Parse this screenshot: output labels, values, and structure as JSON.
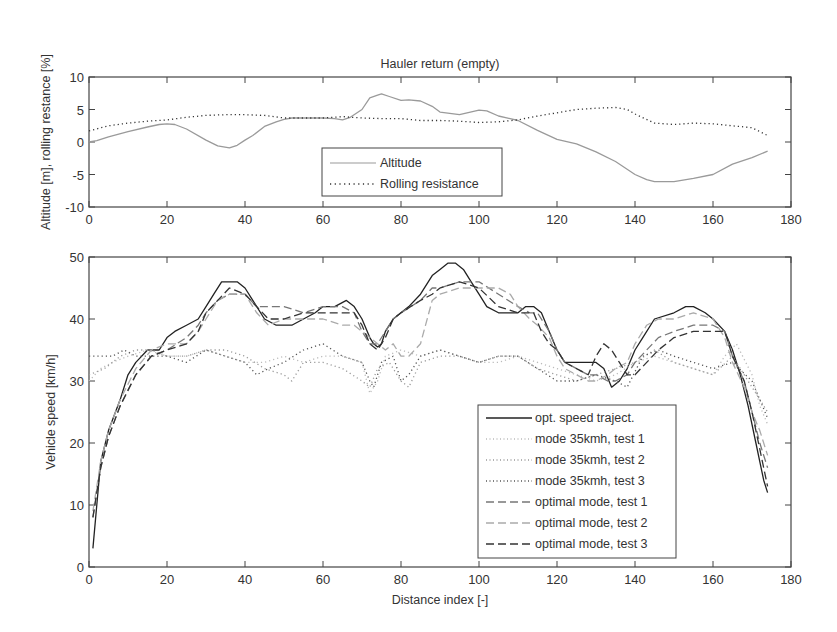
{
  "chart_data": [
    {
      "type": "line",
      "title": "Hauler return (empty)",
      "xlabel": "",
      "ylabel": "Altitude [m], rolling restance [%]",
      "xlim": [
        0,
        180
      ],
      "ylim": [
        -10,
        10
      ],
      "xticks": [
        "0",
        "20",
        "40",
        "60",
        "80",
        "100",
        "120",
        "140",
        "160",
        "180"
      ],
      "yticks": [
        "-10",
        "-5",
        "0",
        "5",
        "10"
      ],
      "grid": false,
      "legend_position": "lower center",
      "series": [
        {
          "name": "Altitude",
          "style": "solid",
          "color": "#9a9a9a",
          "x": [
            0,
            2,
            5,
            10,
            15,
            18,
            20,
            22,
            25,
            30,
            33,
            36,
            38,
            40,
            42,
            45,
            48,
            50,
            52,
            55,
            60,
            63,
            65,
            67,
            70,
            72,
            74,
            75,
            77,
            80,
            82,
            85,
            88,
            90,
            95,
            100,
            102,
            105,
            110,
            115,
            120,
            125,
            130,
            135,
            140,
            143,
            145,
            148,
            150,
            155,
            160,
            165,
            170,
            174
          ],
          "y": [
            0,
            0.2,
            0.8,
            1.6,
            2.3,
            2.7,
            2.8,
            2.7,
            2.0,
            0.3,
            -0.6,
            -0.9,
            -0.5,
            0.3,
            1.0,
            2.4,
            3.1,
            3.5,
            3.7,
            3.7,
            3.7,
            3.6,
            3.4,
            3.8,
            5.0,
            6.8,
            7.2,
            7.4,
            7.0,
            6.4,
            6.5,
            6.3,
            5.5,
            4.6,
            4.2,
            4.9,
            4.8,
            4.0,
            3.3,
            1.8,
            0.4,
            -0.3,
            -1.5,
            -3.0,
            -5.0,
            -5.8,
            -6.1,
            -6.1,
            -6.1,
            -5.6,
            -5.0,
            -3.4,
            -2.4,
            -1.4
          ]
        },
        {
          "name": "Rolling resistance",
          "style": "dotted",
          "color": "#333333",
          "x": [
            0,
            5,
            10,
            15,
            20,
            25,
            30,
            35,
            40,
            45,
            50,
            55,
            60,
            65,
            70,
            75,
            80,
            85,
            90,
            95,
            100,
            105,
            110,
            115,
            120,
            125,
            130,
            135,
            138,
            140,
            145,
            150,
            155,
            160,
            165,
            170,
            174
          ],
          "y": [
            1.7,
            2.5,
            2.9,
            3.2,
            3.4,
            3.8,
            4.1,
            4.2,
            4.2,
            4.1,
            3.7,
            3.7,
            3.7,
            3.9,
            3.7,
            3.6,
            3.6,
            3.3,
            3.3,
            3.2,
            3.0,
            3.1,
            3.4,
            4.0,
            4.5,
            5.0,
            5.2,
            5.3,
            5.0,
            4.3,
            2.9,
            2.7,
            2.9,
            2.8,
            2.5,
            2.2,
            1.0
          ]
        }
      ]
    },
    {
      "type": "line",
      "title": "",
      "xlabel": "Distance index [-]",
      "ylabel": "Vehicle speed [km/h]",
      "xlim": [
        0,
        180
      ],
      "ylim": [
        0,
        50
      ],
      "xticks": [
        "0",
        "20",
        "40",
        "60",
        "80",
        "100",
        "120",
        "140",
        "160",
        "180"
      ],
      "yticks": [
        "0",
        "10",
        "20",
        "30",
        "40",
        "50"
      ],
      "grid": false,
      "legend_position": "lower right",
      "series": [
        {
          "name": "opt. speed traject.",
          "style": "solid",
          "color": "#222222",
          "x": [
            1,
            2,
            3,
            5,
            8,
            10,
            12,
            15,
            18,
            20,
            22,
            25,
            28,
            30,
            32,
            34,
            36,
            38,
            40,
            42,
            45,
            48,
            50,
            52,
            55,
            58,
            60,
            63,
            66,
            68,
            70,
            72,
            73,
            74,
            75,
            76,
            78,
            80,
            82,
            85,
            88,
            90,
            92,
            94,
            96,
            98,
            100,
            102,
            105,
            108,
            110,
            112,
            114,
            116,
            118,
            120,
            122,
            125,
            128,
            130,
            132,
            134,
            136,
            138,
            140,
            142,
            145,
            150,
            153,
            155,
            158,
            160,
            163,
            165,
            167,
            169,
            171,
            172,
            173,
            174
          ],
          "y": [
            3,
            10,
            17,
            22,
            27,
            31,
            33,
            35,
            35,
            37,
            38,
            39,
            40,
            42,
            44,
            46,
            46,
            46,
            45,
            43,
            40,
            39,
            39,
            39,
            40,
            41,
            42,
            42,
            43,
            42,
            40,
            37,
            36,
            35.5,
            36,
            38,
            40,
            41,
            42,
            44,
            47,
            48,
            49,
            49,
            48,
            46,
            44,
            42,
            41,
            41,
            41,
            42,
            42,
            41,
            38,
            35,
            33,
            33,
            33,
            33,
            32,
            29,
            30,
            32,
            35,
            37,
            40,
            41,
            42,
            42,
            41,
            40,
            38,
            35,
            31,
            26,
            20,
            17,
            14,
            12
          ]
        },
        {
          "name": "mode 35kmh, test 1",
          "style": "dotted",
          "color": "#bbbbbb",
          "x": [
            0,
            3,
            6,
            10,
            15,
            20,
            25,
            30,
            35,
            40,
            45,
            50,
            55,
            60,
            65,
            70,
            72,
            74,
            76,
            80,
            85,
            90,
            95,
            100,
            105,
            110,
            115,
            120,
            125,
            130,
            135,
            140,
            145,
            150,
            155,
            160,
            163,
            166,
            170,
            172,
            174
          ],
          "y": [
            30,
            32,
            33,
            34,
            35,
            34,
            34,
            35,
            34,
            33,
            33,
            34,
            33,
            34,
            34,
            33,
            28,
            30,
            34,
            35,
            34,
            35,
            34,
            33,
            33,
            34,
            33,
            32,
            31,
            30,
            31,
            33,
            34,
            33,
            32,
            31,
            34,
            36,
            31,
            26,
            23
          ]
        },
        {
          "name": "mode 35kmh, test 2",
          "style": "dotted",
          "color": "#999999",
          "x": [
            0,
            4,
            8,
            12,
            16,
            20,
            25,
            30,
            35,
            40,
            45,
            50,
            52,
            55,
            60,
            65,
            70,
            72,
            74,
            77,
            80,
            82,
            85,
            90,
            95,
            100,
            105,
            110,
            115,
            120,
            125,
            130,
            135,
            140,
            145,
            150,
            155,
            160,
            165,
            170,
            174
          ],
          "y": [
            31,
            32,
            34,
            35,
            35,
            34,
            34,
            35,
            35,
            34,
            32,
            31,
            30,
            33,
            33,
            32,
            30,
            29,
            32,
            33,
            30,
            29,
            33,
            34,
            34,
            33,
            34,
            34,
            32,
            31,
            30,
            31,
            32,
            33,
            35,
            33,
            32,
            31,
            34,
            29,
            25
          ]
        },
        {
          "name": "mode 35kmh, test 3",
          "style": "dotted",
          "color": "#555555",
          "x": [
            0,
            3,
            6,
            9,
            12,
            16,
            20,
            25,
            30,
            35,
            40,
            43,
            46,
            50,
            55,
            60,
            65,
            70,
            72,
            73,
            75,
            78,
            80,
            82,
            85,
            90,
            95,
            100,
            105,
            110,
            115,
            120,
            125,
            130,
            135,
            138,
            142,
            146,
            150,
            155,
            160,
            165,
            170,
            174
          ],
          "y": [
            34,
            34,
            34,
            35,
            34,
            34,
            34,
            33,
            35,
            34,
            33,
            31,
            32,
            33,
            35,
            36,
            34,
            33,
            30,
            29,
            33,
            34,
            30,
            31,
            34,
            35,
            34,
            33,
            34,
            34,
            32,
            30,
            30,
            31,
            30,
            29,
            34,
            35,
            34,
            33,
            32,
            33,
            30,
            24
          ]
        },
        {
          "name": "optimal mode, test 1",
          "style": "dashed",
          "color": "#777777",
          "x": [
            1,
            3,
            5,
            8,
            12,
            16,
            20,
            25,
            28,
            30,
            33,
            36,
            40,
            43,
            46,
            50,
            55,
            60,
            65,
            68,
            70,
            72,
            74,
            76,
            78,
            80,
            85,
            88,
            90,
            95,
            100,
            105,
            110,
            113,
            115,
            118,
            120,
            122,
            125,
            128,
            130,
            133,
            135,
            138,
            140,
            143,
            146,
            150,
            155,
            160,
            163,
            165,
            168,
            170,
            172,
            174
          ],
          "y": [
            8,
            16,
            21,
            26,
            31,
            34,
            35,
            37,
            39,
            41,
            43,
            44,
            44,
            42,
            42,
            42,
            41,
            42,
            42,
            41,
            38,
            36,
            36,
            38,
            40,
            41,
            43,
            45,
            45,
            46,
            46,
            44,
            42,
            41,
            41,
            38,
            35,
            33,
            32,
            31,
            31,
            30,
            30,
            31,
            33,
            35,
            37,
            38,
            39,
            39,
            38,
            34,
            30,
            25,
            20,
            16
          ]
        },
        {
          "name": "optimal mode, test 2",
          "style": "dashed",
          "color": "#aaaaaa",
          "x": [
            1,
            3,
            5,
            8,
            12,
            16,
            20,
            25,
            28,
            30,
            33,
            36,
            40,
            43,
            46,
            50,
            55,
            60,
            65,
            68,
            70,
            72,
            74,
            76,
            78,
            80,
            82,
            85,
            88,
            90,
            95,
            100,
            105,
            108,
            110,
            113,
            115,
            118,
            120,
            122,
            125,
            128,
            130,
            133,
            135,
            138,
            140,
            143,
            146,
            150,
            155,
            160,
            163,
            165,
            168,
            170,
            172,
            174
          ],
          "y": [
            9,
            17,
            22,
            27,
            32,
            35,
            36,
            36,
            38,
            40,
            43,
            44,
            44,
            41,
            39,
            40,
            40,
            40,
            39,
            39,
            38,
            37,
            36,
            35,
            36,
            34,
            34,
            36,
            43,
            44,
            45,
            45,
            45,
            44,
            42,
            40,
            39,
            37,
            34,
            32,
            31,
            30,
            30,
            31,
            32,
            33,
            36,
            39,
            40,
            40,
            41,
            40,
            37,
            33,
            29,
            25,
            22,
            18
          ]
        },
        {
          "name": "optimal mode, test 3",
          "style": "dashed",
          "color": "#333333",
          "x": [
            1,
            3,
            5,
            8,
            12,
            16,
            20,
            25,
            28,
            30,
            33,
            36,
            40,
            43,
            46,
            50,
            55,
            60,
            65,
            68,
            70,
            72,
            74,
            76,
            78,
            80,
            85,
            88,
            90,
            95,
            100,
            105,
            110,
            114,
            116,
            118,
            120,
            122,
            125,
            128,
            130,
            132,
            134,
            136,
            138,
            140,
            143,
            146,
            150,
            155,
            160,
            163,
            165,
            168,
            170,
            172,
            174
          ],
          "y": [
            8,
            16,
            21,
            26,
            31,
            34,
            35,
            36,
            38,
            41,
            43,
            45,
            44,
            42,
            40,
            40,
            41,
            41,
            41,
            41,
            39,
            36,
            35,
            37,
            40,
            41,
            43,
            44,
            45,
            46,
            45,
            42,
            41,
            41,
            38,
            36,
            35,
            33,
            32,
            31,
            34,
            36,
            35,
            33,
            31,
            31,
            33,
            35,
            37,
            38,
            38,
            38,
            34,
            30,
            25,
            19,
            13
          ]
        }
      ]
    }
  ],
  "top_chart": {
    "title": "Hauler return (empty)",
    "ylabel": "Altitude [m], rolling restance [%]",
    "legend": [
      "Altitude",
      "Rolling resistance"
    ]
  },
  "bottom_chart": {
    "xlabel": "Distance index [-]",
    "ylabel": "Vehicle speed [km/h]",
    "legend": [
      "opt. speed traject.",
      "mode 35kmh, test 1",
      "mode 35kmh, test 2",
      "mode 35kmh, test 3",
      "optimal mode, test 1",
      "optimal mode, test 2",
      "optimal mode, test 3"
    ]
  }
}
